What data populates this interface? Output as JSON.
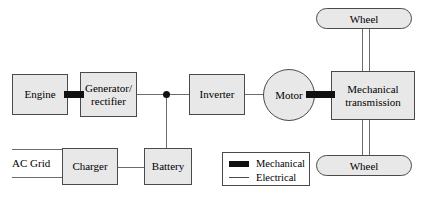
{
  "diagram": {
    "colors": {
      "block_fill": "#e8e8e8",
      "block_stroke": "#4a4a4a",
      "electrical_line": "#6b6b6b",
      "mechanical_link": "#111111",
      "background": "#ffffff"
    },
    "blocks": [
      {
        "id": "engine",
        "label": "Engine"
      },
      {
        "id": "generator_rectifier",
        "label_line1": "Generator/",
        "label_line2": "rectifier"
      },
      {
        "id": "inverter",
        "label": "Inverter"
      },
      {
        "id": "motor",
        "label": "Motor"
      },
      {
        "id": "mechanical_transmission",
        "label_line1": "Mechanical",
        "label_line2": "transmission"
      },
      {
        "id": "wheel_top",
        "label": "Wheel"
      },
      {
        "id": "wheel_bottom",
        "label": "Wheel"
      },
      {
        "id": "charger",
        "label": "Charger"
      },
      {
        "id": "battery",
        "label": "Battery"
      }
    ],
    "free_text": {
      "ac_grid": "AC Grid"
    },
    "legend": {
      "items": [
        {
          "id": "mechanical",
          "label": "Mechanical",
          "style": "thick-black-bar"
        },
        {
          "id": "electrical",
          "label": "Electrical",
          "style": "thin-line"
        }
      ]
    },
    "connections": [
      {
        "from": "engine",
        "to": "generator_rectifier",
        "type": "mechanical"
      },
      {
        "from": "generator_rectifier",
        "to": "dc_bus_junction",
        "type": "electrical"
      },
      {
        "from": "dc_bus_junction",
        "to": "inverter",
        "type": "electrical"
      },
      {
        "from": "dc_bus_junction",
        "to": "battery",
        "type": "electrical"
      },
      {
        "from": "inverter",
        "to": "motor",
        "type": "electrical"
      },
      {
        "from": "motor",
        "to": "mechanical_transmission",
        "type": "mechanical"
      },
      {
        "from": "mechanical_transmission",
        "to": "wheel_top",
        "type": "axle"
      },
      {
        "from": "mechanical_transmission",
        "to": "wheel_bottom",
        "type": "axle"
      },
      {
        "from": "ac_grid",
        "to": "charger",
        "type": "electrical"
      },
      {
        "from": "charger",
        "to": "battery",
        "type": "electrical"
      }
    ]
  }
}
